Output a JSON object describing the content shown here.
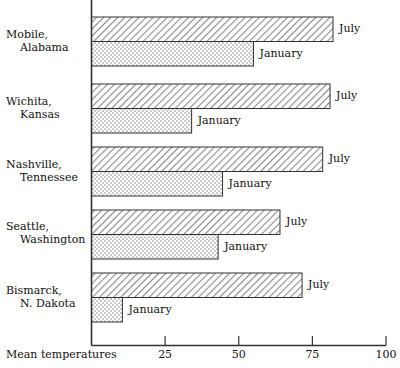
{
  "chart_data": {
    "type": "bar",
    "orientation": "horizontal",
    "title": "",
    "xlabel": "Mean temperatures",
    "ylabel": "",
    "xlim": [
      0,
      100
    ],
    "xticks": [
      25,
      50,
      75,
      100
    ],
    "xtick_labels": [
      "25",
      "50",
      "75",
      "100"
    ],
    "grid": false,
    "legend": "inline-right-of-bar",
    "categories": [
      "Mobile, Alabama",
      "Wichita, Kansas",
      "Nashville, Tennessee",
      "Seattle, Washington",
      "Bismarck, N. Dakota"
    ],
    "series": [
      {
        "name": "July",
        "values": [
          82,
          81,
          78.5,
          64,
          71.5
        ]
      },
      {
        "name": "January",
        "values": [
          55,
          34,
          44.5,
          43,
          10.5
        ]
      }
    ]
  },
  "axis": {
    "title": "Mean temperatures",
    "ticks": [
      {
        "label": "25"
      },
      {
        "label": "50"
      },
      {
        "label": "75"
      },
      {
        "label": "100"
      }
    ]
  },
  "rows": [
    {
      "city_line1": "Mobile,",
      "city_line2": "Alabama",
      "july": {
        "label": "July",
        "value": 82
      },
      "january": {
        "label": "January",
        "value": 55
      }
    },
    {
      "city_line1": "Wichita,",
      "city_line2": "Kansas",
      "july": {
        "label": "July",
        "value": 81
      },
      "january": {
        "label": "January",
        "value": 34
      }
    },
    {
      "city_line1": "Nashville,",
      "city_line2": "Tennessee",
      "july": {
        "label": "July",
        "value": 78.5
      },
      "january": {
        "label": "January",
        "value": 44.5
      }
    },
    {
      "city_line1": "Seattle,",
      "city_line2": "Washington",
      "july": {
        "label": "July",
        "value": 64
      },
      "january": {
        "label": "January",
        "value": 43
      }
    },
    {
      "city_line1": "Bismarck,",
      "city_line2": "N. Dakota",
      "july": {
        "label": "July",
        "value": 71.5
      },
      "january": {
        "label": "January",
        "value": 10.5
      }
    }
  ],
  "colors": {
    "ink": "#111111",
    "july_fill": "#d9d9d9",
    "january_fill": "#f0f0f0",
    "outline": "#333333"
  }
}
